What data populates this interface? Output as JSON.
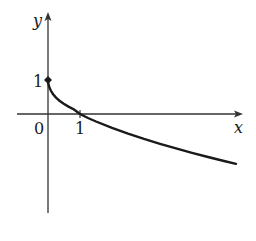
{
  "graph": {
    "axes": {
      "x_label": "x",
      "y_label": "y"
    },
    "ticks": {
      "origin_label": "0",
      "x_tick_label": "1",
      "y_tick_label": "1"
    },
    "curve": {
      "description": "decreasing curve starting at (0,1) with vertical tangent, crossing x-axis at (1,0)",
      "start_point": [
        0,
        1
      ],
      "x_intercept": [
        1,
        0
      ],
      "color": "#1a1a1a"
    },
    "marked_point": [
      0,
      1
    ]
  }
}
